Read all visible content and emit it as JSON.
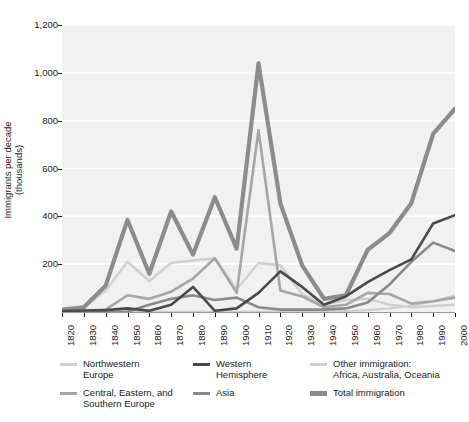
{
  "chart_data": {
    "type": "line",
    "title": "",
    "xlabel": "",
    "ylabel": "Immigrants per decade",
    "ylabel_line2": "(thousands)",
    "ylim": [
      0,
      1200
    ],
    "xlim": [
      1820,
      2000
    ],
    "grid": true,
    "grid_axis": "y",
    "legend_position": "bottom",
    "background": "#f1f1f1",
    "gridline_color": "#ffffff",
    "ytick_labels": [
      "200",
      "400",
      "600",
      "800",
      "1,000",
      "1,200"
    ],
    "ytick_values": [
      200,
      400,
      600,
      800,
      1000,
      1200
    ],
    "x": [
      1820,
      1830,
      1840,
      1850,
      1860,
      1870,
      1880,
      1890,
      1900,
      1910,
      1920,
      1930,
      1940,
      1950,
      1960,
      1970,
      1980,
      1990,
      2000
    ],
    "xtick_labels": [
      "1820",
      "1830",
      "1840",
      "1850",
      "1860",
      "1870",
      "1880",
      "1890",
      "1900",
      "1910",
      "1920",
      "1930",
      "1940",
      "1950",
      "1960",
      "1970",
      "1980",
      "1990",
      "2000"
    ],
    "series": [
      {
        "name": "Northwestern Europe",
        "color": "#d0d0d0",
        "width": 2.6,
        "values": [
          8,
          20,
          90,
          210,
          130,
          205,
          215,
          225,
          95,
          205,
          195,
          75,
          30,
          50,
          55,
          30,
          20,
          25,
          30
        ]
      },
      {
        "name": "Central, Eastern, and Southern Europe",
        "color": "#a6a6a6",
        "width": 2.6,
        "values": [
          2,
          4,
          10,
          70,
          55,
          85,
          140,
          225,
          80,
          760,
          90,
          65,
          20,
          30,
          80,
          75,
          35,
          45,
          60
        ]
      },
      {
        "name": "Western Hemisphere",
        "color": "#4a4a4a",
        "width": 2.6,
        "values": [
          4,
          6,
          8,
          15,
          5,
          30,
          105,
          5,
          15,
          80,
          170,
          105,
          30,
          65,
          125,
          175,
          220,
          370,
          405
        ]
      },
      {
        "name": "Asia",
        "color": "#8a8a8a",
        "width": 2.6,
        "values": [
          0,
          0,
          0,
          2,
          30,
          55,
          70,
          50,
          60,
          20,
          10,
          10,
          10,
          15,
          40,
          115,
          210,
          290,
          255
        ]
      },
      {
        "name": "Other immigration: Africa, Australia, Oceania",
        "color": "#cfcfcf",
        "width": 2.2,
        "values": [
          0,
          0,
          0,
          1,
          1,
          1,
          1,
          1,
          1,
          2,
          2,
          2,
          2,
          4,
          8,
          15,
          25,
          45,
          70
        ]
      },
      {
        "name": "Total immigration",
        "color": "#8c8c8c",
        "width": 4.2,
        "values": [
          10,
          20,
          110,
          385,
          160,
          420,
          240,
          480,
          265,
          1040,
          455,
          195,
          55,
          70,
          260,
          330,
          455,
          745,
          850
        ]
      }
    ]
  },
  "legend": {
    "items": [
      {
        "label": "Northwestern\nEurope",
        "color": "#d0d0d0",
        "thick": false
      },
      {
        "label": "Western\nHemisphere",
        "color": "#4a4a4a",
        "thick": false
      },
      {
        "label": "Other immigration:\nAfrica, Australia, Oceania",
        "color": "#cfcfcf",
        "thick": false
      },
      {
        "label": "Central, Eastern, and\nSouthern Europe",
        "color": "#a6a6a6",
        "thick": false
      },
      {
        "label": "Asia",
        "color": "#8a8a8a",
        "thick": false
      },
      {
        "label": "Total immigration",
        "color": "#8c8c8c",
        "thick": true
      }
    ]
  }
}
